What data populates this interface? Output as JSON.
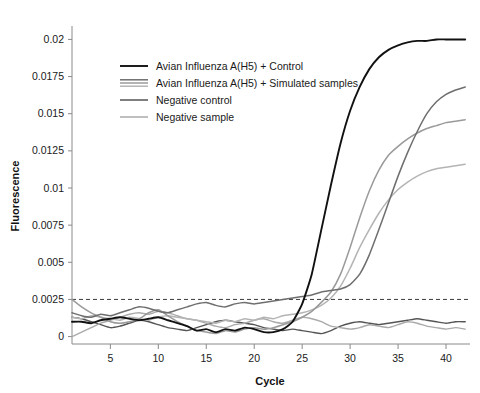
{
  "chart_data": {
    "type": "line",
    "title": "",
    "xlabel": "Cycle",
    "ylabel": "Fluorescence",
    "xlim": [
      1,
      42.5
    ],
    "ylim": [
      -0.0005,
      0.0205
    ],
    "grid": false,
    "legend_position": "upper-left-inside",
    "x_ticks": [
      5,
      10,
      15,
      20,
      25,
      30,
      35,
      40
    ],
    "x_tick_labels": [
      "5",
      "10",
      "15",
      "20",
      "25",
      "30",
      "35",
      "40"
    ],
    "y_ticks": [
      0,
      0.0025,
      0.005,
      0.0075,
      0.01,
      0.0125,
      0.015,
      0.0175,
      0.02
    ],
    "y_tick_labels": [
      "0",
      "0.0025",
      "0.005",
      "0.0075",
      "0.01",
      "0.0125",
      "0.015",
      "0.0175",
      "0.02"
    ],
    "threshold": {
      "value": 0.0025,
      "style": "dashed",
      "label": ""
    },
    "x": [
      1,
      2,
      3,
      4,
      5,
      6,
      7,
      8,
      9,
      10,
      11,
      12,
      13,
      14,
      15,
      16,
      17,
      18,
      19,
      20,
      21,
      22,
      23,
      24,
      25,
      26,
      27,
      28,
      29,
      30,
      31,
      32,
      33,
      34,
      35,
      36,
      37,
      38,
      39,
      40,
      41,
      42
    ],
    "series": [
      {
        "name": "Avian Influenza A(H5) + Control",
        "color": "#111111",
        "width": 1.9,
        "values": [
          0.001,
          0.001,
          0.0009,
          0.0011,
          0.0012,
          0.0013,
          0.0012,
          0.0011,
          0.0012,
          0.0013,
          0.0011,
          0.0009,
          0.0007,
          0.0004,
          0.0005,
          0.0003,
          0.0005,
          0.0004,
          0.0006,
          0.0005,
          0.0003,
          0.0003,
          0.0005,
          0.001,
          0.0022,
          0.0042,
          0.0072,
          0.0102,
          0.013,
          0.0152,
          0.0168,
          0.018,
          0.0188,
          0.0193,
          0.0196,
          0.0198,
          0.0199,
          0.0199,
          0.02,
          0.02,
          0.02,
          0.02
        ]
      },
      {
        "name": "Avian Influenza A(H5) + Simulated samples (1)",
        "legend_group": "Avian Influenza A(H5) + Simulated samples",
        "color": "#6e6e6e",
        "width": 1.5,
        "values": [
          0.0016,
          0.0014,
          0.0013,
          0.0015,
          0.0014,
          0.0016,
          0.0018,
          0.002,
          0.0019,
          0.0017,
          0.0016,
          0.0018,
          0.002,
          0.0022,
          0.0023,
          0.0021,
          0.002,
          0.0022,
          0.0023,
          0.0022,
          0.0023,
          0.0024,
          0.0025,
          0.0026,
          0.0027,
          0.0028,
          0.003,
          0.0031,
          0.0032,
          0.0035,
          0.0042,
          0.0055,
          0.0072,
          0.009,
          0.0108,
          0.0124,
          0.0138,
          0.015,
          0.0158,
          0.0163,
          0.0166,
          0.0168
        ]
      },
      {
        "name": "Avian Influenza A(H5) + Simulated samples (2)",
        "legend_group": "Avian Influenza A(H5) + Simulated samples",
        "color": "#9a9a9a",
        "width": 1.5,
        "values": [
          0.0025,
          0.002,
          0.0016,
          0.0013,
          0.001,
          0.0009,
          0.001,
          0.0012,
          0.0016,
          0.0018,
          0.0014,
          0.001,
          0.0007,
          0.0004,
          0.0003,
          0.0002,
          0.0004,
          0.0003,
          0.0005,
          0.0006,
          0.0005,
          0.0006,
          0.0008,
          0.001,
          0.0013,
          0.0017,
          0.0023,
          0.003,
          0.0042,
          0.006,
          0.008,
          0.0098,
          0.0112,
          0.0122,
          0.0128,
          0.0133,
          0.0137,
          0.014,
          0.0142,
          0.0144,
          0.0145,
          0.0146
        ]
      },
      {
        "name": "Avian Influenza A(H5) + Simulated samples (3)",
        "legend_group": "Avian Influenza A(H5) + Simulated samples",
        "color": "#b4b4b4",
        "width": 1.5,
        "values": [
          0.0013,
          0.0012,
          0.0014,
          0.0013,
          0.0012,
          0.0011,
          0.0013,
          0.0012,
          0.0011,
          0.0013,
          0.0014,
          0.0013,
          0.0012,
          0.0011,
          0.001,
          0.0009,
          0.0011,
          0.001,
          0.0012,
          0.0011,
          0.0013,
          0.0012,
          0.0014,
          0.0015,
          0.0016,
          0.0018,
          0.0021,
          0.0026,
          0.0034,
          0.0046,
          0.006,
          0.0072,
          0.0083,
          0.0092,
          0.0099,
          0.0104,
          0.0108,
          0.0111,
          0.0113,
          0.0114,
          0.0115,
          0.0116
        ]
      },
      {
        "name": "Negative control",
        "color": "#555555",
        "width": 1.4,
        "values": [
          0.0013,
          0.0012,
          0.001,
          0.0008,
          0.0006,
          0.0007,
          0.0009,
          0.0011,
          0.001,
          0.0008,
          0.0006,
          0.0005,
          0.0004,
          0.0006,
          0.0008,
          0.001,
          0.0011,
          0.001,
          0.0009,
          0.0008,
          0.0006,
          0.0005,
          0.0004,
          0.0005,
          0.0004,
          0.0003,
          0.0002,
          0.0004,
          0.0007,
          0.0009,
          0.001,
          0.0009,
          0.0008,
          0.0009,
          0.001,
          0.0011,
          0.0012,
          0.0011,
          0.001,
          0.0009,
          0.001,
          0.001
        ]
      },
      {
        "name": "Negative sample",
        "color": "#aaaaaa",
        "width": 1.4,
        "values": [
          0.0,
          0.0003,
          0.0006,
          0.0009,
          0.0011,
          0.0013,
          0.0015,
          0.0016,
          0.0015,
          0.0017,
          0.0016,
          0.0014,
          0.0012,
          0.0011,
          0.0009,
          0.0007,
          0.0006,
          0.0008,
          0.0009,
          0.0011,
          0.0012,
          0.001,
          0.0009,
          0.0011,
          0.0013,
          0.0012,
          0.001,
          0.0007,
          0.0006,
          0.0005,
          0.0006,
          0.0008,
          0.0007,
          0.0006,
          0.0008,
          0.001,
          0.0009,
          0.0007,
          0.0006,
          0.0005,
          0.0006,
          0.0005
        ]
      }
    ],
    "legend_entries": [
      {
        "label": "Avian Influenza A(H5) + Control",
        "color": "#111111",
        "style": "single"
      },
      {
        "label": "Avian Influenza A(H5) + Simulated samples",
        "color": "#9a9a9a",
        "style": "triple"
      },
      {
        "label": "Negative control",
        "color": "#555555",
        "style": "single"
      },
      {
        "label": "Negative sample",
        "color": "#aaaaaa",
        "style": "single"
      }
    ]
  }
}
